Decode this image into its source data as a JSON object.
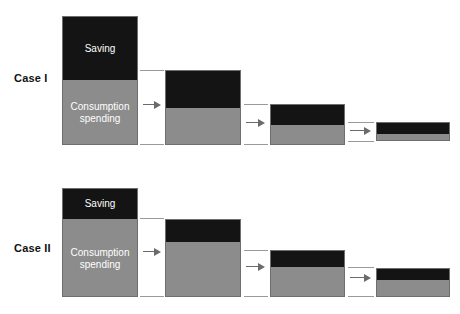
{
  "figure": {
    "type": "diagram",
    "background_color": "#ffffff",
    "saving_color": "#141414",
    "consumption_color": "#8c8c8c",
    "border_color": "#6e6e6e",
    "arrow_color": "#6b6b6b",
    "guide_color": "#9a9a9a",
    "label_color": "#111111"
  },
  "cases": [
    {
      "label": "Case I",
      "label_x": 14,
      "label_y": 72,
      "bars": [
        {
          "name": "round-1",
          "x": 62,
          "y": 16,
          "width": 76,
          "height": 129,
          "saving_height": 63,
          "consumption_height": 66,
          "saving_label": "Saving",
          "consumption_label": "Consumption spending"
        },
        {
          "name": "round-2",
          "x": 165,
          "y": 70,
          "width": 76,
          "height": 75,
          "saving_height": 37,
          "consumption_height": 38,
          "saving_label": "",
          "consumption_label": ""
        },
        {
          "name": "round-3",
          "x": 270,
          "y": 104,
          "width": 75,
          "height": 41,
          "saving_height": 20,
          "consumption_height": 21,
          "saving_label": "",
          "consumption_label": ""
        },
        {
          "name": "round-4",
          "x": 376,
          "y": 122,
          "width": 74,
          "height": 19,
          "saving_height": 11,
          "consumption_height": 8,
          "saving_label": "",
          "consumption_label": ""
        }
      ],
      "arrows": [
        {
          "name": "arrow-1",
          "x": 143,
          "y": 104,
          "width": 18
        },
        {
          "name": "arrow-2",
          "x": 246,
          "y": 122,
          "width": 19
        },
        {
          "name": "arrow-3",
          "x": 350,
          "y": 130,
          "width": 21
        }
      ],
      "guides": [
        {
          "x": 140,
          "y": 70,
          "width": 24
        },
        {
          "x": 140,
          "y": 144,
          "width": 24
        },
        {
          "x": 244,
          "y": 104,
          "width": 24
        },
        {
          "x": 244,
          "y": 144,
          "width": 24
        },
        {
          "x": 348,
          "y": 122,
          "width": 26
        },
        {
          "x": 348,
          "y": 141,
          "width": 26
        }
      ]
    },
    {
      "label": "Case II",
      "label_x": 14,
      "label_y": 242,
      "bars": [
        {
          "name": "round-1",
          "x": 62,
          "y": 188,
          "width": 76,
          "height": 109,
          "saving_height": 30,
          "consumption_height": 79,
          "saving_label": "Saving",
          "consumption_label": "Consumption spending"
        },
        {
          "name": "round-2",
          "x": 165,
          "y": 219,
          "width": 76,
          "height": 78,
          "saving_height": 22,
          "consumption_height": 56,
          "saving_label": "",
          "consumption_label": ""
        },
        {
          "name": "round-3",
          "x": 270,
          "y": 250,
          "width": 75,
          "height": 47,
          "saving_height": 16,
          "consumption_height": 31,
          "saving_label": "",
          "consumption_label": ""
        },
        {
          "name": "round-4",
          "x": 376,
          "y": 268,
          "width": 74,
          "height": 29,
          "saving_height": 11,
          "consumption_height": 18,
          "saving_label": "",
          "consumption_label": ""
        }
      ],
      "arrows": [
        {
          "name": "arrow-1",
          "x": 143,
          "y": 251,
          "width": 18
        },
        {
          "name": "arrow-2",
          "x": 246,
          "y": 266,
          "width": 19
        },
        {
          "name": "arrow-3",
          "x": 350,
          "y": 277,
          "width": 21
        }
      ],
      "guides": [
        {
          "x": 140,
          "y": 218,
          "width": 24
        },
        {
          "x": 140,
          "y": 296,
          "width": 24
        },
        {
          "x": 244,
          "y": 250,
          "width": 24
        },
        {
          "x": 244,
          "y": 296,
          "width": 24
        },
        {
          "x": 348,
          "y": 267,
          "width": 26
        },
        {
          "x": 348,
          "y": 296,
          "width": 26
        }
      ]
    }
  ]
}
